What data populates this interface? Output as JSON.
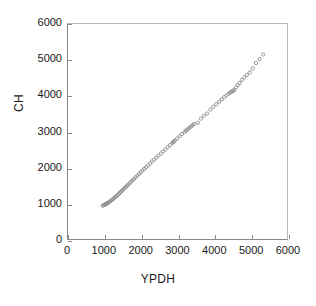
{
  "chart_data": {
    "type": "scatter",
    "title": "",
    "xlabel": "YPDH",
    "ylabel": "CH",
    "xlim": [
      0,
      6000
    ],
    "ylim": [
      0,
      6000
    ],
    "xticks": [
      0,
      1000,
      2000,
      3000,
      4000,
      5000,
      6000
    ],
    "yticks": [
      0,
      1000,
      2000,
      3000,
      4000,
      5000,
      6000
    ],
    "xtick_labels": [
      "0",
      "1000",
      "2000",
      "3000",
      "4000",
      "5000",
      "6000"
    ],
    "ytick_labels": [
      "0",
      "1000",
      "2000",
      "3000",
      "4000",
      "5000",
      "6000"
    ],
    "grid": false,
    "legend": null,
    "marker": "open-circle",
    "marker_color": "#8d8d8d",
    "series": [
      {
        "name": "CH vs YPDH",
        "points": [
          [
            950,
            930
          ],
          [
            975,
            945
          ],
          [
            1000,
            955
          ],
          [
            1020,
            965
          ],
          [
            1045,
            975
          ],
          [
            1065,
            990
          ],
          [
            1090,
            1005
          ],
          [
            1110,
            1020
          ],
          [
            1140,
            1040
          ],
          [
            1165,
            1060
          ],
          [
            1190,
            1080
          ],
          [
            1215,
            1100
          ],
          [
            1245,
            1125
          ],
          [
            1270,
            1150
          ],
          [
            1300,
            1175
          ],
          [
            1330,
            1200
          ],
          [
            1360,
            1230
          ],
          [
            1390,
            1260
          ],
          [
            1420,
            1290
          ],
          [
            1450,
            1320
          ],
          [
            1480,
            1350
          ],
          [
            1515,
            1385
          ],
          [
            1545,
            1415
          ],
          [
            1580,
            1450
          ],
          [
            1615,
            1485
          ],
          [
            1650,
            1520
          ],
          [
            1690,
            1560
          ],
          [
            1730,
            1600
          ],
          [
            1770,
            1640
          ],
          [
            1810,
            1680
          ],
          [
            1855,
            1725
          ],
          [
            1900,
            1770
          ],
          [
            1945,
            1815
          ],
          [
            1995,
            1865
          ],
          [
            2040,
            1910
          ],
          [
            2090,
            1960
          ],
          [
            2140,
            2005
          ],
          [
            2195,
            2055
          ],
          [
            2250,
            2110
          ],
          [
            2305,
            2165
          ],
          [
            2360,
            2215
          ],
          [
            2420,
            2270
          ],
          [
            2480,
            2330
          ],
          [
            2540,
            2385
          ],
          [
            2600,
            2440
          ],
          [
            2665,
            2500
          ],
          [
            2730,
            2560
          ],
          [
            2795,
            2620
          ],
          [
            2860,
            2680
          ],
          [
            2880,
            2700
          ],
          [
            2900,
            2720
          ],
          [
            2930,
            2750
          ],
          [
            2990,
            2805
          ],
          [
            3060,
            2870
          ],
          [
            3125,
            2930
          ],
          [
            3195,
            2990
          ],
          [
            3230,
            3020
          ],
          [
            3265,
            3050
          ],
          [
            3300,
            3080
          ],
          [
            3335,
            3110
          ],
          [
            3370,
            3140
          ],
          [
            3410,
            3175
          ],
          [
            3450,
            3210
          ],
          [
            3560,
            3245
          ],
          [
            3640,
            3360
          ],
          [
            3720,
            3440
          ],
          [
            3810,
            3500
          ],
          [
            3900,
            3610
          ],
          [
            3980,
            3690
          ],
          [
            4060,
            3760
          ],
          [
            4140,
            3830
          ],
          [
            4215,
            3900
          ],
          [
            4280,
            3960
          ],
          [
            4340,
            4010
          ],
          [
            4395,
            4050
          ],
          [
            4440,
            4085
          ],
          [
            4470,
            4105
          ],
          [
            4500,
            4120
          ],
          [
            4530,
            4140
          ],
          [
            4560,
            4160
          ],
          [
            4600,
            4230
          ],
          [
            4650,
            4290
          ],
          [
            4700,
            4350
          ],
          [
            4760,
            4440
          ],
          [
            4830,
            4510
          ],
          [
            4900,
            4580
          ],
          [
            4980,
            4650
          ],
          [
            5060,
            4760
          ],
          [
            5150,
            4910
          ],
          [
            5250,
            5020
          ],
          [
            5350,
            5150
          ]
        ]
      }
    ]
  },
  "axes": {
    "x_title": "YPDH",
    "y_title": "CH"
  }
}
